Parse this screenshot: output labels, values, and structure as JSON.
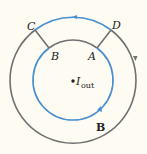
{
  "diagram": {
    "colors": {
      "background": "#fdfbf2",
      "path_blue": "#4a8fd0",
      "field_gray": "#707070",
      "text": "#222222"
    },
    "labels": {
      "C": "C",
      "D": "D",
      "B_point": "B",
      "A": "A",
      "current_symbol": "I",
      "current_subscript": "out",
      "field_vector": "B"
    }
  }
}
